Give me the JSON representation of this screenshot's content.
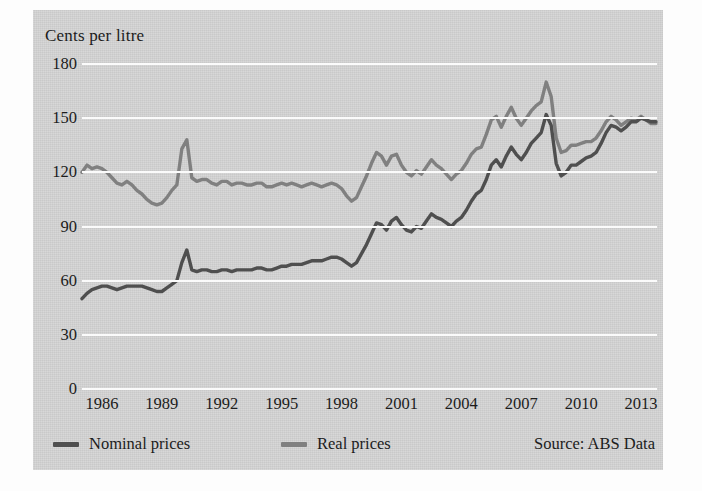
{
  "chart_data": {
    "type": "line",
    "title": "Cents per litre",
    "xlabel": "",
    "ylabel": "Cents per litre",
    "ylim": [
      0,
      180
    ],
    "xlim": [
      1985.0,
      2013.8
    ],
    "yticks": [
      0,
      30,
      60,
      90,
      120,
      150,
      180
    ],
    "xticks": [
      1986,
      1989,
      1992,
      1995,
      1998,
      2001,
      2004,
      2007,
      2010,
      2013
    ],
    "grid": "horizontal-white",
    "legend_position": "below-axes-left",
    "source_note": "Source: ABS Data",
    "series": [
      {
        "name": "Nominal prices",
        "color": "#4f4f4f",
        "x": [
          1985.0,
          1985.25,
          1985.5,
          1985.75,
          1986.0,
          1986.25,
          1986.5,
          1986.75,
          1987.0,
          1987.25,
          1987.5,
          1987.75,
          1988.0,
          1988.25,
          1988.5,
          1988.75,
          1989.0,
          1989.25,
          1989.5,
          1989.75,
          1990.0,
          1990.25,
          1990.5,
          1990.75,
          1991.0,
          1991.25,
          1991.5,
          1991.75,
          1992.0,
          1992.25,
          1992.5,
          1992.75,
          1993.0,
          1993.25,
          1993.5,
          1993.75,
          1994.0,
          1994.25,
          1994.5,
          1994.75,
          1995.0,
          1995.25,
          1995.5,
          1995.75,
          1996.0,
          1996.25,
          1996.5,
          1996.75,
          1997.0,
          1997.25,
          1997.5,
          1997.75,
          1998.0,
          1998.25,
          1998.5,
          1998.75,
          1999.0,
          1999.25,
          1999.5,
          1999.75,
          2000.0,
          2000.25,
          2000.5,
          2000.75,
          2001.0,
          2001.25,
          2001.5,
          2001.75,
          2002.0,
          2002.25,
          2002.5,
          2002.75,
          2003.0,
          2003.25,
          2003.5,
          2003.75,
          2004.0,
          2004.25,
          2004.5,
          2004.75,
          2005.0,
          2005.25,
          2005.5,
          2005.75,
          2006.0,
          2006.25,
          2006.5,
          2006.75,
          2007.0,
          2007.25,
          2007.5,
          2007.75,
          2008.0,
          2008.25,
          2008.5,
          2008.75,
          2009.0,
          2009.25,
          2009.5,
          2009.75,
          2010.0,
          2010.25,
          2010.5,
          2010.75,
          2011.0,
          2011.25,
          2011.5,
          2011.75,
          2012.0,
          2012.25,
          2012.5,
          2012.75,
          2013.0,
          2013.25,
          2013.5,
          2013.75
        ],
        "values": [
          50,
          53,
          55,
          56,
          57,
          57,
          56,
          55,
          56,
          57,
          57,
          57,
          57,
          56,
          55,
          54,
          54,
          56,
          58,
          60,
          70,
          77,
          66,
          65,
          66,
          66,
          65,
          65,
          66,
          66,
          65,
          66,
          66,
          66,
          66,
          67,
          67,
          66,
          66,
          67,
          68,
          68,
          69,
          69,
          69,
          70,
          71,
          71,
          71,
          72,
          73,
          73,
          72,
          70,
          68,
          70,
          75,
          80,
          86,
          92,
          91,
          88,
          93,
          95,
          91,
          88,
          87,
          90,
          89,
          93,
          97,
          95,
          94,
          92,
          90,
          93,
          95,
          99,
          104,
          108,
          110,
          116,
          124,
          127,
          123,
          129,
          134,
          130,
          127,
          131,
          136,
          139,
          142,
          152,
          146,
          125,
          118,
          120,
          124,
          124,
          126,
          128,
          129,
          131,
          136,
          142,
          146,
          145,
          143,
          145,
          148,
          148,
          150,
          149,
          148,
          148
        ]
      },
      {
        "name": "Real prices",
        "color": "#808080",
        "x": [
          1985.0,
          1985.25,
          1985.5,
          1985.75,
          1986.0,
          1986.25,
          1986.5,
          1986.75,
          1987.0,
          1987.25,
          1987.5,
          1987.75,
          1988.0,
          1988.25,
          1988.5,
          1988.75,
          1989.0,
          1989.25,
          1989.5,
          1989.75,
          1990.0,
          1990.25,
          1990.5,
          1990.75,
          1991.0,
          1991.25,
          1991.5,
          1991.75,
          1992.0,
          1992.25,
          1992.5,
          1992.75,
          1993.0,
          1993.25,
          1993.5,
          1993.75,
          1994.0,
          1994.25,
          1994.5,
          1994.75,
          1995.0,
          1995.25,
          1995.5,
          1995.75,
          1996.0,
          1996.25,
          1996.5,
          1996.75,
          1997.0,
          1997.25,
          1997.5,
          1997.75,
          1998.0,
          1998.25,
          1998.5,
          1998.75,
          1999.0,
          1999.25,
          1999.5,
          1999.75,
          2000.0,
          2000.25,
          2000.5,
          2000.75,
          2001.0,
          2001.25,
          2001.5,
          2001.75,
          2002.0,
          2002.25,
          2002.5,
          2002.75,
          2003.0,
          2003.25,
          2003.5,
          2003.75,
          2004.0,
          2004.25,
          2004.5,
          2004.75,
          2005.0,
          2005.25,
          2005.5,
          2005.75,
          2006.0,
          2006.25,
          2006.5,
          2006.75,
          2007.0,
          2007.25,
          2007.5,
          2007.75,
          2008.0,
          2008.25,
          2008.5,
          2008.75,
          2009.0,
          2009.25,
          2009.5,
          2009.75,
          2010.0,
          2010.25,
          2010.5,
          2010.75,
          2011.0,
          2011.25,
          2011.5,
          2011.75,
          2012.0,
          2012.25,
          2012.5,
          2012.75,
          2013.0,
          2013.25,
          2013.5,
          2013.75
        ],
        "values": [
          120,
          124,
          122,
          123,
          122,
          120,
          117,
          114,
          113,
          115,
          113,
          110,
          108,
          105,
          103,
          102,
          103,
          106,
          110,
          113,
          133,
          138,
          117,
          115,
          116,
          116,
          114,
          113,
          115,
          115,
          113,
          114,
          114,
          113,
          113,
          114,
          114,
          112,
          112,
          113,
          114,
          113,
          114,
          113,
          112,
          113,
          114,
          113,
          112,
          113,
          114,
          113,
          111,
          107,
          104,
          106,
          112,
          118,
          125,
          131,
          129,
          124,
          129,
          130,
          124,
          120,
          118,
          121,
          119,
          123,
          127,
          124,
          122,
          119,
          116,
          119,
          121,
          125,
          130,
          133,
          134,
          141,
          149,
          151,
          145,
          151,
          156,
          150,
          146,
          150,
          154,
          157,
          159,
          170,
          162,
          139,
          131,
          132,
          135,
          135,
          136,
          137,
          137,
          139,
          143,
          148,
          151,
          149,
          146,
          148,
          150,
          149,
          151,
          149,
          147,
          147
        ]
      }
    ]
  },
  "legend": {
    "items": [
      {
        "label": "Nominal prices",
        "color": "#4f4f4f"
      },
      {
        "label": "Real prices",
        "color": "#808080"
      }
    ]
  },
  "source": {
    "text": "Source: ABS Data"
  }
}
